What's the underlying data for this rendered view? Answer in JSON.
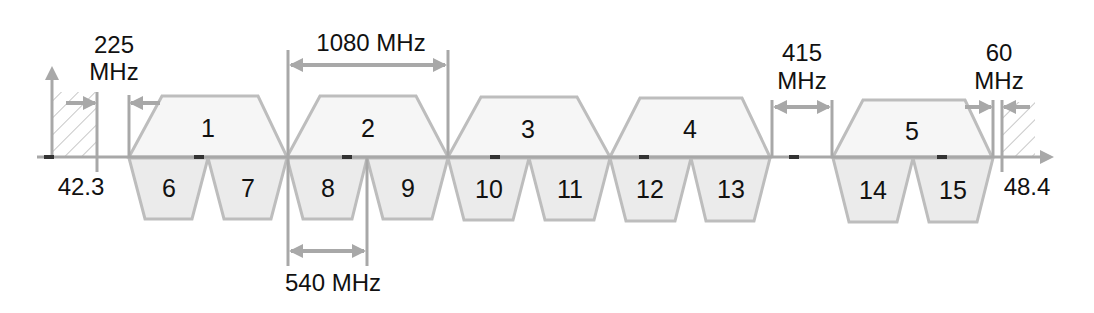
{
  "diagram": {
    "type": "frequency-channel-plan",
    "axis": {
      "start_label": "42.3",
      "end_label": "48.4",
      "unit": "GHz (implied)"
    },
    "dimensions": {
      "guard_left": {
        "value": "225",
        "unit": "MHz"
      },
      "wide_channel": {
        "label": "1080 MHz"
      },
      "narrow_channel": {
        "label": "540 MHz"
      },
      "gap": {
        "value": "415",
        "unit": "MHz"
      },
      "guard_right": {
        "value": "60",
        "unit": "MHz"
      }
    },
    "wide_channels": [
      {
        "id": "1"
      },
      {
        "id": "2"
      },
      {
        "id": "3"
      },
      {
        "id": "4"
      },
      {
        "id": "5"
      }
    ],
    "narrow_channels": [
      {
        "id": "6"
      },
      {
        "id": "7"
      },
      {
        "id": "8"
      },
      {
        "id": "9"
      },
      {
        "id": "10"
      },
      {
        "id": "11"
      },
      {
        "id": "12"
      },
      {
        "id": "13"
      },
      {
        "id": "14"
      },
      {
        "id": "15"
      }
    ],
    "colors": {
      "outline": "#bdbdbd",
      "axis": "#a8a8a8",
      "wide_fill": "#f6f6f6",
      "narrow_fill": "#ebebeb",
      "marker": "#333333",
      "text": "#111111"
    }
  }
}
